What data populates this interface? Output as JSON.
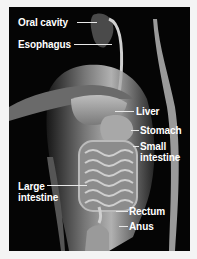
{
  "diagram": {
    "style": "grayscale anatomical illustration",
    "colors": {
      "background": "#050505",
      "border": "#f4f4f4",
      "label_text": "#ffffff",
      "leader_line": "#e8e8e8"
    },
    "labels": {
      "oral_cavity": "Oral cavity",
      "esophagus": "Esophagus",
      "liver": "Liver",
      "stomach": "Stomach",
      "small_intestine_line1": "Small",
      "small_intestine_line2": "intestine",
      "large_intestine_line1": "Large",
      "large_intestine_line2": "intestine",
      "rectum": "Rectum",
      "anus": "Anus"
    }
  }
}
